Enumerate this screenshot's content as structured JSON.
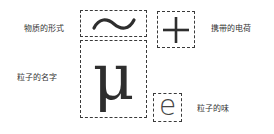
{
  "labels": {
    "form": "物质的形式",
    "charge": "携带的电荷",
    "name": "粒子的名字",
    "flavor": "粒子的味"
  },
  "symbols": {
    "form": "~",
    "charge": "+",
    "name": "μ",
    "flavor": "e"
  },
  "colors": {
    "stroke": "#3a3a3a",
    "text": "#333333"
  }
}
